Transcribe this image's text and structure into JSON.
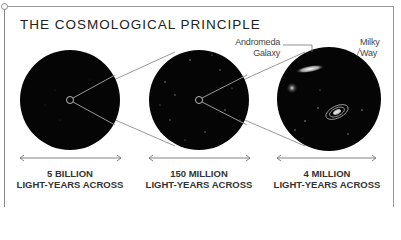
{
  "title": "THE COSMOLOGICAL PRINCIPLE",
  "panels": [
    {
      "scale_line1": "5 BILLION",
      "scale_line2": "LIGHT-YEARS ACROSS"
    },
    {
      "scale_line1": "150 MILLION",
      "scale_line2": "LIGHT-YEARS ACROSS"
    },
    {
      "scale_line1": "4 MILLION",
      "scale_line2": "LIGHT-YEARS ACROSS"
    }
  ],
  "annotations": {
    "andromeda_line1": "Andromeda",
    "andromeda_line2": "Galaxy",
    "milkyway_line1": "Milky",
    "milkyway_line2": "Way"
  },
  "colors": {
    "circle_fill": "#050505",
    "line": "#888888",
    "text": "#333333"
  }
}
